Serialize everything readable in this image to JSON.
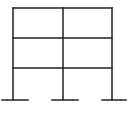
{
  "diagram": {
    "type": "structural-frame",
    "bays": 2,
    "stories": 3,
    "stroke_color": "#222222",
    "stroke_width": 1.5,
    "columns_x": [
      13,
      63,
      112
    ],
    "levels_y": [
      8,
      38,
      68
    ],
    "base_y": 100,
    "supports": [
      {
        "x1": 2,
        "x2": 28
      },
      {
        "x1": 52,
        "x2": 78
      },
      {
        "x1": 102,
        "x2": 126
      }
    ]
  }
}
